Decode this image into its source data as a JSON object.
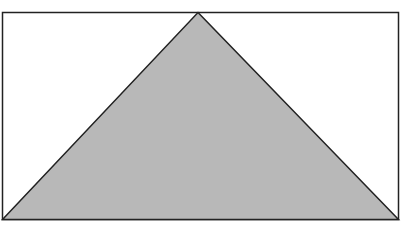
{
  "figure": {
    "colors": {
      "background": "#ffffff",
      "stroke": "#222222",
      "triangle_fill": "#b8b8b8"
    },
    "rectangle": {
      "x": 2.5,
      "y": 12.5,
      "width": 396,
      "height": 207
    },
    "triangle": {
      "points": [
        {
          "x": 198,
          "y": 12.5
        },
        {
          "x": 398.5,
          "y": 219.5
        },
        {
          "x": 2.5,
          "y": 219.5
        }
      ]
    }
  }
}
